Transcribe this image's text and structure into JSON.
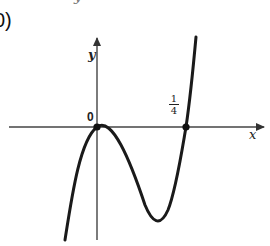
{
  "figure": {
    "panel_label": "0)",
    "top_fragment": "y",
    "axes": {
      "x_label": "x",
      "y_label": "y",
      "origin_label": "0"
    },
    "marked_points": [
      {
        "label": "0",
        "x": 0,
        "y": 0
      },
      {
        "label_numerator": "1",
        "label_denominator": "4",
        "x": 0.25,
        "y": 0
      }
    ],
    "curve": {
      "description": "cubic with double root at 0 (local max) and simple root at 1/4",
      "local_max_x": 0,
      "local_min_x": 0.1667,
      "roots": [
        0,
        0.25
      ]
    },
    "colors": {
      "axis": "#444444",
      "curve": "#1a1a1a",
      "background": "#ffffff"
    }
  }
}
